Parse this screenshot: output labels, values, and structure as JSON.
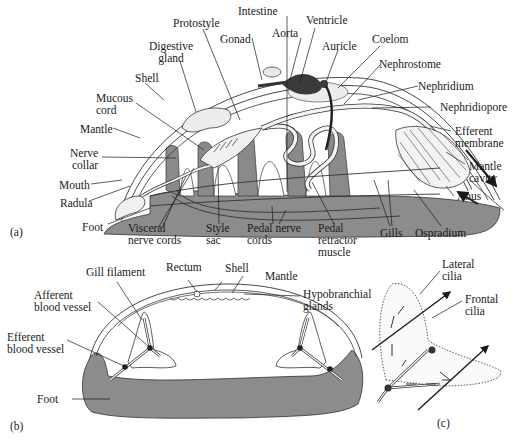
{
  "figure": {
    "colors": {
      "foot_gray": "#8c8c8c",
      "ink": "#1a1a1a",
      "heart_dark": "#3a3a3a",
      "tissue_light": "#e6e6e6"
    },
    "panel_a": {
      "tag": "(a)",
      "labels": {
        "protostyle": "Protostyle",
        "intestine": "Intestine",
        "ventricle": "Ventricle",
        "gonad": "Gonad",
        "aorta": "Aorta",
        "auricle": "Auricle",
        "coelom": "Coelom",
        "digestive_gland": "Digestive\ngland",
        "nephrostome": "Nephrostome",
        "shell": "Shell",
        "nephridium": "Nephridium",
        "mucous_cord": "Mucous\ncord",
        "nephridiopore": "Nephridiopore",
        "mantle": "Mantle",
        "efferent_membrane": "Efferent\nmembrane",
        "nerve_collar": "Nerve\ncollar",
        "mantle_cavity": "Mantle\ncavity",
        "mouth": "Mouth",
        "anus": "Anus",
        "radula": "Radula",
        "foot": "Foot",
        "visceral_nerve_cords": "Visceral\nnerve cords",
        "style_sac": "Style\nsac",
        "pedal_nerve_cords": "Pedal nerve\ncords",
        "pedal_retractor_muscle": "Pedal\nretractor\nmuscle",
        "gills": "Gills",
        "ospradium": "Ospradium"
      }
    },
    "panel_b": {
      "tag": "(b)",
      "labels": {
        "gill_filament": "Gill filament",
        "rectum": "Rectum",
        "shell": "Shell",
        "mantle": "Mantle",
        "afferent_blood_vessel": "Afferent\nblood vessel",
        "hypobranchial_glands": "Hypobranchial\nglands",
        "efferent_blood_vessel": "Efferent\nblood vessel",
        "foot": "Foot"
      }
    },
    "panel_c": {
      "tag": "(c)",
      "labels": {
        "lateral_cilia": "Lateral\ncilia",
        "frontal_cilia": "Frontal\ncilia"
      }
    }
  }
}
